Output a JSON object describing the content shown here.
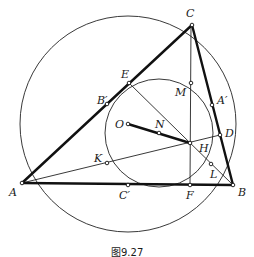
{
  "figure": {
    "caption": "图9.27",
    "colors": {
      "stroke": "#111111",
      "background": "#ffffff"
    }
  },
  "points": {
    "A": {
      "label": "A",
      "x": 22,
      "y": 183
    },
    "B": {
      "label": "B",
      "x": 233,
      "y": 185
    },
    "C": {
      "label": "C",
      "x": 192,
      "y": 25
    },
    "O": {
      "label": "O",
      "x": 128,
      "y": 124
    },
    "N": {
      "label": "N",
      "x": 159,
      "y": 133
    },
    "H": {
      "label": "H",
      "x": 190,
      "y": 143
    },
    "D": {
      "label": "D",
      "x": 220,
      "y": 135
    },
    "E": {
      "label": "E",
      "x": 129,
      "y": 83
    },
    "F": {
      "label": "F",
      "x": 190,
      "y": 185
    },
    "M": {
      "label": "M",
      "x": 191,
      "y": 83
    },
    "K": {
      "label": "K",
      "x": 107,
      "y": 163
    },
    "L": {
      "label": "L",
      "x": 211,
      "y": 164
    },
    "A_prime": {
      "label": "A′",
      "x": 212,
      "y": 105
    },
    "B_prime": {
      "label": "B′",
      "x": 107,
      "y": 104
    },
    "C_prime": {
      "label": "C′",
      "x": 128,
      "y": 185
    }
  },
  "circles": {
    "circumcircle": {
      "cx": 128,
      "cy": 124,
      "r": 108
    },
    "nine_point": {
      "cx": 159,
      "cy": 133,
      "r": 54
    }
  }
}
